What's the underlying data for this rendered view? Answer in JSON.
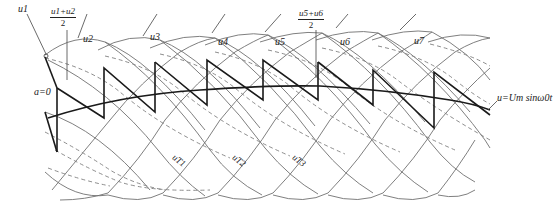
{
  "diagram": {
    "type": "cycloconverter-output-waveform",
    "labels": {
      "u1": "u1",
      "u2": "u2",
      "u3": "u3",
      "u4": "u4",
      "u5": "u5",
      "u6": "u6",
      "u7": "u7",
      "avg12_num": "u1+u2",
      "avg12_den": "2",
      "avg56_num": "u5+u6",
      "avg56_den": "2",
      "alpha": "a=0",
      "reference": "u=Um sinω0t",
      "uT1": "uT1",
      "uT2": "uT2",
      "uT3": "uT3"
    },
    "colors": {
      "thin_line": "#6a6a6a",
      "bold_line": "#1a1a1a",
      "dashed_line": "#7a7a7a",
      "background": "#ffffff"
    }
  }
}
